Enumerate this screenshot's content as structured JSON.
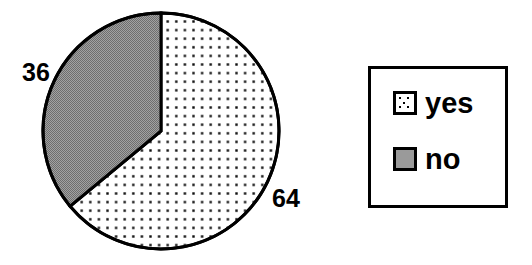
{
  "chart_data": {
    "type": "pie",
    "title": "",
    "categories": [
      "yes",
      "no"
    ],
    "values": [
      64,
      36
    ],
    "labels": [
      "64",
      "36"
    ],
    "units": "percent",
    "total": 100,
    "start_angle_deg": 0,
    "direction": "clockwise",
    "legend_position": "right",
    "grid": false,
    "slices": [
      {
        "name": "yes",
        "value": 64,
        "label": "64",
        "fill_style": "dotted",
        "fill_color": "#ffffff",
        "dot_color": "#000000",
        "outline_color": "#000000",
        "start_deg": 0,
        "end_deg": 230.4,
        "label_x": 272,
        "label_y": 186
      },
      {
        "name": "no",
        "value": 36,
        "label": "36",
        "fill_style": "solid-gray",
        "fill_color": "#8c8c8c",
        "outline_color": "#000000",
        "start_deg": 230.4,
        "end_deg": 360,
        "label_x": 22,
        "label_y": 60
      }
    ],
    "geometry": {
      "center_x": 161,
      "center_y": 131,
      "radius": 118,
      "outline_width": 3
    }
  },
  "legend": {
    "border_color": "#000000",
    "background_color": "#ffffff",
    "entries": [
      {
        "label": "yes",
        "swatch_name": "dotted-swatch"
      },
      {
        "label": "no",
        "swatch_name": "gray-swatch"
      }
    ]
  },
  "colors": {
    "background": "#ffffff",
    "outline": "#000000",
    "gray_fill": "#8c8c8c",
    "text": "#000000"
  }
}
